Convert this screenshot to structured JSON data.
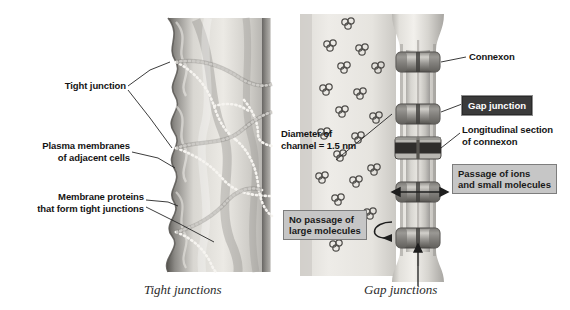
{
  "figure": {
    "title_left_caption": "Tight junctions",
    "title_right_caption": "Gap junctions"
  },
  "left_panel": {
    "name": "tight-junction-illustration",
    "labels": [
      {
        "id": "tight-junction",
        "text": "Tight junction"
      },
      {
        "id": "plasma-membranes",
        "text": "Plasma membranes\nof adjacent cells"
      },
      {
        "id": "membrane-proteins",
        "text": "Membrane proteins\nthat form tight junctions"
      }
    ],
    "caption": "Tight junctions"
  },
  "right_panel": {
    "name": "gap-junction-illustration",
    "labels": [
      {
        "id": "connexon",
        "text": "Connexon",
        "style": "plain"
      },
      {
        "id": "gap-junction",
        "text": "Gap junction",
        "style": "dark-box"
      },
      {
        "id": "longitudinal-section",
        "text": "Longitudinal section\nof connexon",
        "style": "plain"
      },
      {
        "id": "passage-ions",
        "text": "Passage of ions\nand small molecules",
        "style": "light-box"
      },
      {
        "id": "no-passage",
        "text": "No passage of\nlarge molecules",
        "style": "light-box"
      },
      {
        "id": "channel-diameter",
        "text": "Diameter of\nchannel = 1.5 nm",
        "style": "plain"
      }
    ],
    "measurements": {
      "channel_diameter_value": "1.5",
      "channel_diameter_unit": "nm"
    },
    "caption": "Gap junctions"
  },
  "colors": {
    "background": "#ffffff",
    "text": "#141414",
    "leader_line": "#2b2b2b",
    "dark_box_fill": "#3a3a3a",
    "dark_box_text": "#ffffff",
    "light_box_fill": "#c6c6c6",
    "light_box_border": "#7d7d7d",
    "membrane_light": "#e8e6e2",
    "membrane_mid": "#b6b4b1",
    "membrane_dark": "#6f6d6b",
    "connexon_dark": "#4a4846",
    "strand_dots": "#f4f2ee"
  }
}
